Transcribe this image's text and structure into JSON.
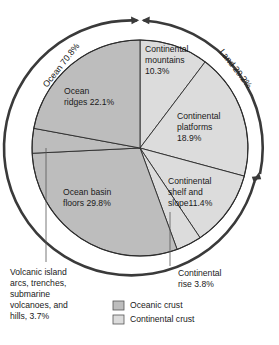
{
  "chart_data": {
    "type": "pie",
    "title": "",
    "unit": "percent",
    "center": [
      140,
      148
    ],
    "radius": 108,
    "start_angle_deg": 0,
    "direction": "clockwise",
    "legend": {
      "position": "bottom",
      "entries": [
        {
          "label": "Oceanic crust",
          "color": "#bdbdbd"
        },
        {
          "label": "Continental crust",
          "color": "#dcdcdc"
        }
      ]
    },
    "groups": [
      {
        "name": "Ocean",
        "label": "Ocean 70.8%",
        "value": 70.8,
        "color": "#bdbdbd"
      },
      {
        "name": "Land",
        "label": "Land 29.2%",
        "value": 29.2,
        "color": "#dcdcdc"
      }
    ],
    "categories": [
      "Continental mountains",
      "Continental platforms",
      "Continental shelf and slope",
      "Continental rise",
      "Ocean basin floors",
      "Volcanic island arcs, trenches, submarine volcanoes, and hills",
      "Ocean ridges"
    ],
    "values": [
      10.3,
      18.9,
      11.4,
      3.8,
      29.8,
      3.7,
      22.1
    ],
    "slices": [
      {
        "key": "continental-mountains",
        "label": "Continental mountains 10.3%",
        "value": 10.3,
        "crust": "continental",
        "color": "#dcdcdc",
        "a0": 0.0,
        "a1": 37.1
      },
      {
        "key": "continental-platforms",
        "label": "Continental platforms 18.9%",
        "value": 18.9,
        "crust": "continental",
        "color": "#dcdcdc",
        "a0": 37.1,
        "a1": 105.1
      },
      {
        "key": "continental-shelf-slope",
        "label": "Continental shelf and slope11.4%",
        "value": 11.4,
        "crust": "continental",
        "color": "#dcdcdc",
        "a0": 105.1,
        "a1": 146.2
      },
      {
        "key": "continental-rise",
        "label": "Continental rise 3.8%",
        "value": 3.8,
        "crust": "continental",
        "color": "#dcdcdc",
        "a0": 146.2,
        "a1": 159.9
      },
      {
        "key": "ocean-basin-floors",
        "label": "Ocean basin floors 29.8%",
        "value": 29.8,
        "crust": "oceanic",
        "color": "#bdbdbd",
        "a0": 159.9,
        "a1": 267.2
      },
      {
        "key": "volcanic-island-arcs",
        "label": "Volcanic island arcs, trenches, submarine volcanoes, and hills, 3.7%",
        "value": 3.7,
        "crust": "oceanic",
        "color": "#bdbdbd",
        "a0": 267.2,
        "a1": 280.5
      },
      {
        "key": "ocean-ridges",
        "label": "Ocean ridges 22.1%",
        "value": 22.1,
        "crust": "oceanic",
        "color": "#bdbdbd",
        "a0": 280.5,
        "a1": 360.0
      }
    ]
  },
  "labels": {
    "continental_mountains": [
      "Continental",
      "mountains",
      "10.3%"
    ],
    "continental_platforms": [
      "Continental",
      "platforms",
      "18.9%"
    ],
    "continental_shelf": [
      "Continental",
      "shelf and",
      "slope11.4%"
    ],
    "continental_rise": [
      "Continental",
      "rise 3.8%"
    ],
    "ocean_ridges": [
      "Ocean",
      "ridges 22.1%"
    ],
    "ocean_basin_floors": [
      "Ocean basin",
      "floors 29.8%"
    ],
    "volcanic": [
      "Volcanic island",
      "arcs, trenches,",
      "submarine",
      "volcanoes, and",
      "hills, 3.7%"
    ],
    "ocean_arc": "Ocean 70.8%",
    "land_arc": "Land 29.2%"
  },
  "legend": {
    "oceanic": "Oceanic crust",
    "continental": "Continental crust"
  },
  "colors": {
    "oceanic_crust": "#bdbdbd",
    "continental_crust": "#dcdcdc",
    "outline": "#2b2b2b",
    "arc": "#3a3a3a",
    "background": "#ffffff"
  }
}
